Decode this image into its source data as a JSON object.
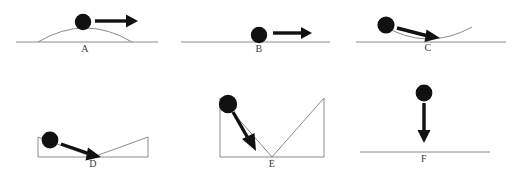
{
  "figure": {
    "width": 522,
    "height": 178,
    "background_color": "#ffffff",
    "line_color": "#8a8a8a",
    "ink_color": "#111111",
    "label_color": "#3a3a3a"
  },
  "panels": [
    {
      "id": "A",
      "label": "A",
      "surface": "convex-hill-on-ground-line",
      "ball": {
        "cx": 83,
        "cy": 22,
        "r": 8
      },
      "arrow": {
        "direction": "right-horizontal",
        "x1": 95,
        "y1": 21,
        "x2": 132,
        "y2": 21
      },
      "label_pos": {
        "x": 85,
        "y": 45
      }
    },
    {
      "id": "B",
      "label": "B",
      "surface": "flat-ground-line",
      "ball": {
        "cx": 259,
        "cy": 35,
        "r": 8
      },
      "arrow": {
        "direction": "right-horizontal",
        "x1": 272,
        "y1": 33,
        "x2": 307,
        "y2": 33
      },
      "label_pos": {
        "x": 259,
        "y": 45
      }
    },
    {
      "id": "C",
      "label": "C",
      "surface": "concave-valley-on-ground-line",
      "ball": {
        "cx": 388,
        "cy": 25,
        "r": 8
      },
      "arrow": {
        "direction": "down-right",
        "x1": 398,
        "y1": 29,
        "x2": 434,
        "y2": 38
      },
      "label_pos": {
        "x": 428,
        "y": 44
      }
    },
    {
      "id": "D",
      "label": "D",
      "surface": "shallow-v-wedge",
      "ball": {
        "cx": 50,
        "cy": 140,
        "r": 8
      },
      "arrow": {
        "direction": "down-right",
        "x1": 60,
        "y1": 144,
        "x2": 95,
        "y2": 158
      },
      "label_pos": {
        "x": 93,
        "y": 160
      }
    },
    {
      "id": "E",
      "label": "E",
      "surface": "deep-v-with-vertical-walls",
      "ball": {
        "cx": 228,
        "cy": 104,
        "r": 9
      },
      "arrow": {
        "direction": "down-right-steep",
        "x1": 234,
        "y1": 112,
        "x2": 254,
        "y2": 148
      },
      "label_pos": {
        "x": 272,
        "y": 160
      }
    },
    {
      "id": "F",
      "label": "F",
      "surface": "flat-ground-line",
      "ball": {
        "cx": 424,
        "cy": 93,
        "r": 8
      },
      "arrow": {
        "direction": "down-vertical",
        "x1": 424,
        "y1": 102,
        "x2": 424,
        "y2": 140
      },
      "label_pos": {
        "x": 424,
        "y": 155
      }
    }
  ]
}
